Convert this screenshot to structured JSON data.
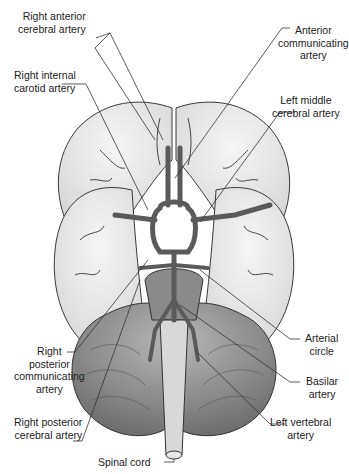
{
  "diagram": {
    "colors": {
      "cerebrum_fill": "#ececec",
      "cerebellum_fill": "#9a9a9a",
      "artery_fill": "#6e6e6e",
      "outline": "#3a3a3a",
      "leader_line": "#333333",
      "text": "#222222"
    },
    "labels": {
      "right_anterior_cerebral": {
        "line1": "Right anterior",
        "line2": "cerebral artery"
      },
      "right_internal_carotid": {
        "line1": "Right internal",
        "line2": "carotid artery"
      },
      "anterior_communicating": {
        "line1": "Anterior",
        "line2": "communicating",
        "line3": "artery"
      },
      "left_middle_cerebral": {
        "line1": "Left middle",
        "line2": "cerebral artery"
      },
      "arterial_circle": {
        "line1": "Arterial",
        "line2": "circle"
      },
      "basilar": {
        "line1": "Basilar",
        "line2": "artery"
      },
      "right_posterior_communicating": {
        "line1": "Right",
        "line2": "posterior",
        "line3": "communicating",
        "line4": "artery"
      },
      "right_posterior_cerebral": {
        "line1": "Right posterior",
        "line2": "cerebral  artery"
      },
      "left_vertebral": {
        "line1": "Left vertebral",
        "line2": "artery"
      },
      "spinal_cord": {
        "line1": "Spinal cord"
      }
    }
  }
}
